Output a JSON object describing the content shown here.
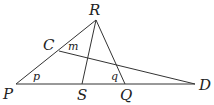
{
  "diagram": {
    "points": {
      "P": {
        "label": "P",
        "x": 16,
        "y": 84,
        "lx": 3,
        "ly": 99
      },
      "R": {
        "label": "R",
        "x": 96,
        "y": 20,
        "lx": 89,
        "ly": 15
      },
      "C": {
        "label": "C",
        "x": 59,
        "y": 51,
        "lx": 43,
        "ly": 50
      },
      "S": {
        "label": "S",
        "x": 82,
        "y": 84,
        "lx": 77,
        "ly": 100
      },
      "Q": {
        "label": "Q",
        "x": 125,
        "y": 84,
        "lx": 120,
        "ly": 100
      },
      "D": {
        "label": "D",
        "x": 195,
        "y": 84,
        "lx": 199,
        "ly": 90
      }
    },
    "segments": [
      [
        "P",
        "R"
      ],
      [
        "R",
        "Q"
      ],
      [
        "R",
        "S"
      ],
      [
        "P",
        "D"
      ],
      [
        "C",
        "D"
      ]
    ],
    "angle_labels": {
      "p": {
        "label": "p",
        "x": 33,
        "y": 80
      },
      "m": {
        "label": "m",
        "x": 68,
        "y": 50
      },
      "q": {
        "label": "q",
        "x": 111,
        "y": 80
      }
    }
  }
}
